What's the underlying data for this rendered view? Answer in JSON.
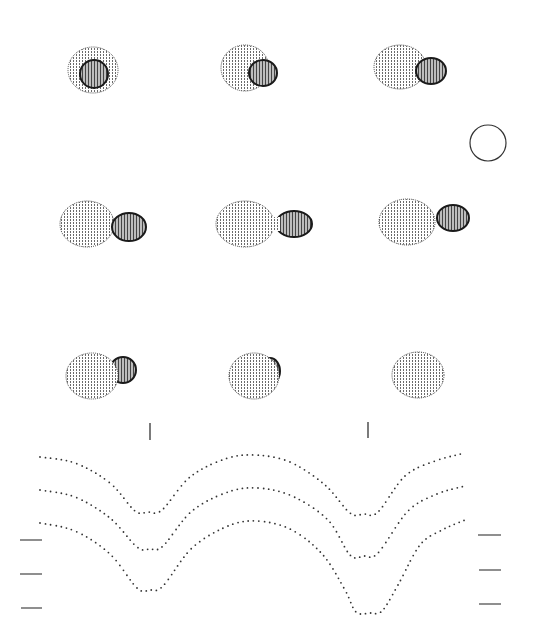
{
  "figure": {
    "background": "#ffffff",
    "ink": "#222222",
    "star_fill_primary": "#f2f2f2",
    "star_fill_secondary": "#cfcfcf"
  },
  "frames": [
    {
      "id": "phase-1",
      "cx": 93,
      "cy": 70,
      "primary": {
        "dx": 0,
        "dy": 0,
        "rx": 25,
        "ry": 23
      },
      "secondary": {
        "dx": 1,
        "dy": 4,
        "rx": 14,
        "ry": 14
      },
      "order": "secondary-front"
    },
    {
      "id": "phase-2",
      "cx": 245,
      "cy": 68,
      "primary": {
        "dx": 0,
        "dy": 0,
        "rx": 24,
        "ry": 23
      },
      "secondary": {
        "dx": 18,
        "dy": 5,
        "rx": 14,
        "ry": 13
      },
      "order": "secondary-front"
    },
    {
      "id": "phase-3",
      "cx": 400,
      "cy": 67,
      "primary": {
        "dx": 0,
        "dy": 0,
        "rx": 26,
        "ry": 22
      },
      "secondary": {
        "dx": 31,
        "dy": 4,
        "rx": 15,
        "ry": 13
      },
      "order": "secondary-front"
    },
    {
      "id": "phase-4",
      "cx": 87,
      "cy": 224,
      "primary": {
        "dx": 0,
        "dy": 0,
        "rx": 27,
        "ry": 23
      },
      "secondary": {
        "dx": 42,
        "dy": 3,
        "rx": 17,
        "ry": 14
      },
      "order": "secondary-front"
    },
    {
      "id": "phase-5",
      "cx": 245,
      "cy": 224,
      "primary": {
        "dx": 0,
        "dy": 0,
        "rx": 29,
        "ry": 23
      },
      "secondary": {
        "dx": 49,
        "dy": 0,
        "rx": 18,
        "ry": 13
      },
      "order": "contact"
    },
    {
      "id": "phase-6",
      "cx": 407,
      "cy": 222,
      "primary": {
        "dx": 0,
        "dy": 0,
        "rx": 28,
        "ry": 23
      },
      "secondary": {
        "dx": 46,
        "dy": -4,
        "rx": 16,
        "ry": 13
      },
      "order": "secondary-front"
    },
    {
      "id": "phase-7",
      "cx": 92,
      "cy": 376,
      "primary": {
        "dx": 0,
        "dy": 0,
        "rx": 26,
        "ry": 23
      },
      "secondary": {
        "dx": 31,
        "dy": -6,
        "rx": 13,
        "ry": 13
      },
      "order": "primary-front"
    },
    {
      "id": "phase-8",
      "cx": 254,
      "cy": 376,
      "primary": {
        "dx": 0,
        "dy": 0,
        "rx": 25,
        "ry": 23
      },
      "secondary": {
        "dx": 16,
        "dy": -5,
        "rx": 10,
        "ry": 13
      },
      "order": "primary-front"
    },
    {
      "id": "phase-9",
      "cx": 418,
      "cy": 375,
      "primary": {
        "dx": 0,
        "dy": 0,
        "rx": 26,
        "ry": 23
      },
      "secondary": null,
      "order": "primary-only"
    }
  ],
  "reference_circle": {
    "cx": 488,
    "cy": 143,
    "r": 18
  },
  "phase_ticks": [
    {
      "x": 150,
      "y1": 423,
      "y2": 440
    },
    {
      "x": 368,
      "y1": 422,
      "y2": 438
    }
  ],
  "left_markers": [
    {
      "x1": 20,
      "x2": 42,
      "y": 540
    },
    {
      "x1": 20,
      "x2": 42,
      "y": 574
    },
    {
      "x1": 21,
      "x2": 42,
      "y": 608
    }
  ],
  "right_markers": [
    {
      "x1": 478,
      "x2": 501,
      "y": 535
    },
    {
      "x1": 479,
      "x2": 501,
      "y": 570
    },
    {
      "x1": 479,
      "x2": 501,
      "y": 604
    }
  ],
  "chart_data": {
    "type": "scatter",
    "xlabel": "",
    "ylabel": "",
    "x_range_px": [
      40,
      465
    ],
    "grid": false,
    "legend": null,
    "series": [
      {
        "name": "curve-1",
        "keypoints": [
          {
            "x": 40,
            "y": 457
          },
          {
            "x": 75,
            "y": 463
          },
          {
            "x": 110,
            "y": 483
          },
          {
            "x": 135,
            "y": 511
          },
          {
            "x": 148,
            "y": 512
          },
          {
            "x": 162,
            "y": 510
          },
          {
            "x": 190,
            "y": 477
          },
          {
            "x": 225,
            "y": 459
          },
          {
            "x": 255,
            "y": 455
          },
          {
            "x": 290,
            "y": 462
          },
          {
            "x": 325,
            "y": 485
          },
          {
            "x": 350,
            "y": 513
          },
          {
            "x": 364,
            "y": 514
          },
          {
            "x": 378,
            "y": 512
          },
          {
            "x": 405,
            "y": 476
          },
          {
            "x": 435,
            "y": 461
          },
          {
            "x": 465,
            "y": 453
          }
        ]
      },
      {
        "name": "curve-2",
        "keypoints": [
          {
            "x": 40,
            "y": 490
          },
          {
            "x": 75,
            "y": 497
          },
          {
            "x": 110,
            "y": 518
          },
          {
            "x": 137,
            "y": 547
          },
          {
            "x": 150,
            "y": 549
          },
          {
            "x": 163,
            "y": 546
          },
          {
            "x": 192,
            "y": 511
          },
          {
            "x": 228,
            "y": 492
          },
          {
            "x": 258,
            "y": 488
          },
          {
            "x": 292,
            "y": 496
          },
          {
            "x": 328,
            "y": 520
          },
          {
            "x": 350,
            "y": 555
          },
          {
            "x": 364,
            "y": 556
          },
          {
            "x": 378,
            "y": 553
          },
          {
            "x": 408,
            "y": 511
          },
          {
            "x": 437,
            "y": 494
          },
          {
            "x": 465,
            "y": 486
          }
        ]
      },
      {
        "name": "curve-3",
        "keypoints": [
          {
            "x": 40,
            "y": 523
          },
          {
            "x": 75,
            "y": 531
          },
          {
            "x": 110,
            "y": 554
          },
          {
            "x": 137,
            "y": 588
          },
          {
            "x": 150,
            "y": 590
          },
          {
            "x": 163,
            "y": 586
          },
          {
            "x": 192,
            "y": 548
          },
          {
            "x": 228,
            "y": 526
          },
          {
            "x": 258,
            "y": 521
          },
          {
            "x": 292,
            "y": 530
          },
          {
            "x": 323,
            "y": 555
          },
          {
            "x": 345,
            "y": 590
          },
          {
            "x": 356,
            "y": 612
          },
          {
            "x": 370,
            "y": 613
          },
          {
            "x": 382,
            "y": 611
          },
          {
            "x": 398,
            "y": 585
          },
          {
            "x": 420,
            "y": 545
          },
          {
            "x": 442,
            "y": 530
          },
          {
            "x": 465,
            "y": 520
          }
        ]
      }
    ],
    "point_spacing_px": 5,
    "annotations": [
      "phase tick at x≈150 (primary minimum)",
      "phase tick at x≈368 (secondary minimum)"
    ]
  }
}
